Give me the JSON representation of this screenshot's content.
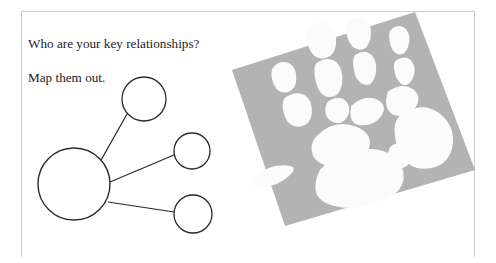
{
  "page": {
    "background_color": "#ffffff",
    "frame_color": "#cccccc"
  },
  "prompt": {
    "line1": "Who are your key relationships?",
    "line2": "Map them out.",
    "text_color": "#1b1b1b"
  },
  "relationship_map": {
    "stroke_color": "#2a2a2a",
    "fill_color": "#ffffff",
    "nodes": [
      {
        "id": "self",
        "label": "",
        "cx": 52,
        "cy": 122,
        "r": 36
      },
      {
        "id": "relation-1",
        "label": "",
        "cx": 122,
        "cy": 37,
        "r": 22
      },
      {
        "id": "relation-2",
        "label": "",
        "cx": 170,
        "cy": 89,
        "r": 18
      },
      {
        "id": "relation-3",
        "label": "",
        "cx": 171,
        "cy": 152,
        "r": 19
      }
    ],
    "links": [
      {
        "from": "self",
        "to": "relation-1"
      },
      {
        "from": "self",
        "to": "relation-2"
      },
      {
        "from": "self",
        "to": "relation-3"
      }
    ]
  },
  "handprint_photo": {
    "alt": "white handprint on grey square",
    "paper_color": "#b3b3b3",
    "print_color": "#fbfbfb",
    "rotation_deg": -15
  }
}
